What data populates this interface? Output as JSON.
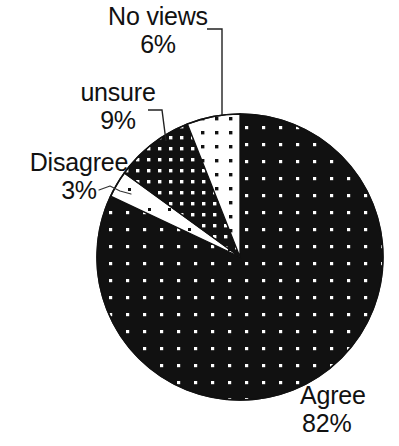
{
  "chart_data": {
    "type": "pie",
    "title": "",
    "subtitle": "",
    "xlabel": "",
    "ylabel": "",
    "legend_position": "none",
    "grid": false,
    "labels_outside": true,
    "units": "percent",
    "categories": [
      "Agree",
      "No views",
      "unsure",
      "Disagree"
    ],
    "values": [
      82,
      6,
      9,
      3
    ],
    "slices": [
      {
        "name": "Agree",
        "label": "Agree",
        "value": 82,
        "value_text": "82%",
        "fill_style": "black-with-white-dots",
        "fill_color": "#111111",
        "dot_color": "#ffffff",
        "start_angle_deg": 0,
        "end_angle_deg": 295.2
      },
      {
        "name": "No views",
        "label": "No views",
        "value": 6,
        "value_text": "6%",
        "fill_style": "white-with-black-dots",
        "fill_color": "#ffffff",
        "dot_color": "#111111",
        "start_angle_deg": 295.2,
        "end_angle_deg": 316.8
      },
      {
        "name": "unsure",
        "label": "unsure",
        "value": 9,
        "value_text": "9%",
        "fill_style": "black-with-dense-white-dots",
        "fill_color": "#111111",
        "dot_color": "#ffffff",
        "start_angle_deg": 316.8,
        "end_angle_deg": 349.2
      },
      {
        "name": "Disagree",
        "label": "Disagree",
        "value": 3,
        "value_text": "3%",
        "fill_style": "white-with-sparse-black-dots",
        "fill_color": "#ffffff",
        "dot_color": "#111111",
        "start_angle_deg": 349.2,
        "end_angle_deg": 360
      }
    ]
  },
  "labels": {
    "agree": {
      "name": "Agree",
      "pct": "82%"
    },
    "no_views": {
      "name": "No views",
      "pct": "6%"
    },
    "unsure": {
      "name": "unsure",
      "pct": "9%"
    },
    "disagree": {
      "name": "Disagree",
      "pct": "3%"
    }
  },
  "colors": {
    "ink": "#111111",
    "paper": "#ffffff"
  }
}
